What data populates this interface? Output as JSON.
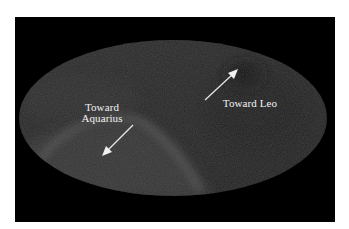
{
  "figure": {
    "type": "all-sky map (Mollweide projection)",
    "background_color": "#ffffff",
    "panel_color": "#000000",
    "sky_base_color": "#2a2a2a",
    "labels": {
      "aquarius_line1": "Toward",
      "aquarius_line2": "Aquarius",
      "leo": "Toward Leo"
    },
    "arrows": [
      {
        "name": "arrow-toward-leo",
        "from": [
          205,
          100
        ],
        "to": [
          237,
          70
        ],
        "color": "#e8e8e8"
      },
      {
        "name": "arrow-toward-aquarius",
        "from": [
          133,
          125
        ],
        "to": [
          103,
          155
        ],
        "color": "#e8e8e8"
      }
    ],
    "ellipse": {
      "cx": 173,
      "cy": 118,
      "rx": 154,
      "ry": 78
    }
  }
}
